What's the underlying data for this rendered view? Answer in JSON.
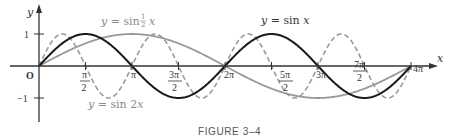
{
  "chart_data": {
    "type": "line",
    "title": "",
    "caption": "FIGURE 3–4",
    "xlabel": "x",
    "ylabel": "y",
    "xlim": [
      0,
      12.566
    ],
    "ylim": [
      -1,
      1
    ],
    "grid": false,
    "legend": "inline annotations",
    "x_ticks": [
      "π/2",
      "π",
      "3π/2",
      "2π",
      "5π/2",
      "3π",
      "7π/2",
      "4π"
    ],
    "x_tick_values": [
      1.5708,
      3.1416,
      4.7124,
      6.2832,
      7.854,
      9.4248,
      10.9956,
      12.5664
    ],
    "y_ticks": [
      "1",
      "−1"
    ],
    "y_tick_values": [
      1,
      -1
    ],
    "origin_label": "O",
    "series": [
      {
        "name": "y = sin x",
        "style": "solid",
        "color": "#1a1a1a",
        "function": "sin(x)",
        "x": [
          0,
          1.5708,
          3.1416,
          4.7124,
          6.2832,
          7.854,
          9.4248,
          10.9956,
          12.5664
        ],
        "values": [
          0,
          1,
          0,
          -1,
          0,
          1,
          0,
          -1,
          0
        ]
      },
      {
        "name": "y = sin ½x",
        "style": "solid",
        "color": "#999999",
        "function": "sin(x/2)",
        "x": [
          0,
          1.5708,
          3.1416,
          4.7124,
          6.2832,
          7.854,
          9.4248,
          10.9956,
          12.5664
        ],
        "values": [
          0,
          0.707,
          1,
          0.707,
          0,
          -0.707,
          -1,
          -0.707,
          0
        ]
      },
      {
        "name": "y = sin 2x",
        "style": "dashed",
        "color": "#999999",
        "function": "sin(2x)",
        "x": [
          0,
          0.7854,
          1.5708,
          2.3562,
          3.1416,
          3.927,
          4.7124,
          5.4978,
          6.2832,
          7.0686,
          7.854,
          8.6394,
          9.4248,
          10.2102,
          10.9956,
          11.781,
          12.5664
        ],
        "values": [
          0,
          1,
          0,
          -1,
          0,
          1,
          0,
          -1,
          0,
          1,
          0,
          -1,
          0,
          1,
          0,
          -1,
          0
        ]
      }
    ],
    "annotations": [
      {
        "text_prefix": "y = sin ",
        "frac_num": "1",
        "frac_den": "2",
        "text_suffix": "x",
        "series": "y = sin ½x"
      },
      {
        "text": "y = sin x",
        "series": "y = sin x"
      },
      {
        "text": "y = sin 2x",
        "series": "y = sin 2x"
      }
    ]
  }
}
